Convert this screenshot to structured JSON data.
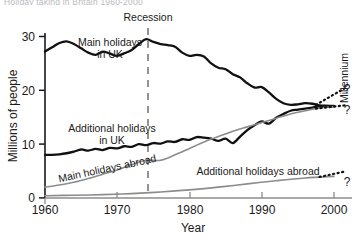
{
  "figure": {
    "cut_off_title": "Holiday taking in Britain 1960-2000",
    "width": 363,
    "height": 246
  },
  "chart_data": {
    "type": "line",
    "title": "",
    "xlabel": "Year",
    "ylabel": "Millions of people",
    "xlim": [
      1960,
      2000
    ],
    "ylim": [
      0,
      30
    ],
    "xticks": [
      "1960",
      "1970",
      "1980",
      "1990",
      "2000"
    ],
    "yticks": [
      "0",
      "10",
      "20",
      "30"
    ],
    "grid": false,
    "legend": "inline-labels",
    "series": [
      {
        "name": "Main holidays in UK",
        "color": "#111111",
        "style": "solid",
        "width": 2.3,
        "label_lines": [
          "Main holidays",
          "in UK"
        ],
        "x": [
          1960,
          1961,
          1962,
          1963,
          1964,
          1965,
          1966,
          1967,
          1968,
          1969,
          1970,
          1971,
          1972,
          1973,
          1974,
          1975,
          1976,
          1977,
          1978,
          1979,
          1980,
          1981,
          1982,
          1983,
          1984,
          1985,
          1986,
          1987,
          1988,
          1989,
          1990,
          1991,
          1992,
          1993,
          1994,
          1995,
          1996,
          1997,
          1998,
          1999,
          2000
        ],
        "y": [
          27.2,
          28.0,
          28.8,
          29.1,
          28.6,
          27.8,
          27.0,
          26.6,
          27.2,
          26.8,
          26.4,
          26.9,
          27.5,
          28.6,
          29.5,
          29.0,
          28.6,
          28.4,
          28.1,
          27.0,
          26.4,
          26.6,
          26.3,
          25.0,
          24.2,
          23.9,
          23.0,
          22.4,
          21.3,
          20.5,
          20.6,
          19.6,
          18.4,
          17.6,
          17.3,
          17.4,
          17.6,
          17.5,
          17.2,
          17.1,
          17.0
        ]
      },
      {
        "name": "Additional holidays in UK",
        "color": "#111111",
        "style": "solid",
        "width": 2.3,
        "label_lines": [
          "Additional holidays",
          "in UK"
        ],
        "x": [
          1960,
          1961,
          1962,
          1963,
          1964,
          1965,
          1966,
          1967,
          1968,
          1969,
          1970,
          1971,
          1972,
          1973,
          1974,
          1975,
          1976,
          1977,
          1978,
          1979,
          1980,
          1981,
          1982,
          1983,
          1984,
          1985,
          1986,
          1987,
          1988,
          1989,
          1990,
          1991,
          1992,
          1993,
          1994,
          1995,
          1996,
          1997,
          1998,
          1999,
          2000
        ],
        "y": [
          8.0,
          8.0,
          8.1,
          8.3,
          8.6,
          9.0,
          8.8,
          9.1,
          8.9,
          9.3,
          9.2,
          9.6,
          9.5,
          10.0,
          9.8,
          10.2,
          10.1,
          10.5,
          10.4,
          10.9,
          10.8,
          11.3,
          11.2,
          11.0,
          10.6,
          11.0,
          10.2,
          11.4,
          12.6,
          13.5,
          14.2,
          13.8,
          14.9,
          15.6,
          16.2,
          16.4,
          16.6,
          16.8,
          17.0,
          17.1,
          17.1
        ]
      },
      {
        "name": "Main holidays abroad",
        "color": "#8c8c8c",
        "style": "solid",
        "width": 1.6,
        "label_lines": [
          "Main holidays abroad"
        ],
        "x": [
          1960,
          1962,
          1964,
          1966,
          1968,
          1970,
          1972,
          1974,
          1976,
          1978,
          1980,
          1982,
          1984,
          1986,
          1988,
          1990,
          1992,
          1994,
          1996,
          1998,
          2000
        ],
        "y": [
          2.0,
          2.4,
          2.9,
          3.6,
          4.4,
          5.2,
          6.2,
          7.0,
          7.0,
          8.0,
          9.2,
          10.4,
          11.4,
          12.4,
          13.2,
          14.0,
          14.8,
          15.6,
          16.2,
          16.7,
          17.0
        ]
      },
      {
        "name": "Additional holidays abroad",
        "color": "#8c8c8c",
        "style": "solid",
        "width": 1.6,
        "label_lines": [
          "Additional holidays abroad"
        ],
        "x": [
          1960,
          1964,
          1968,
          1972,
          1976,
          1980,
          1984,
          1988,
          1992,
          1996,
          2000
        ],
        "y": [
          0.4,
          0.5,
          0.6,
          0.8,
          1.1,
          1.5,
          2.0,
          2.6,
          3.2,
          3.7,
          4.0
        ]
      }
    ],
    "forecasts": [
      {
        "name": "forecast-upper",
        "style": "dotted",
        "from": [
          1997.5,
          17.3
        ],
        "to": [
          2001.5,
          20.4
        ],
        "marker": "?"
      },
      {
        "name": "forecast-middle",
        "style": "dotted",
        "from": [
          1997.5,
          16.6
        ],
        "to": [
          2001.5,
          17.2
        ],
        "marker": "?"
      },
      {
        "name": "forecast-lower",
        "style": "dotted",
        "from": [
          1998.0,
          3.9
        ],
        "to": [
          2001.5,
          4.9
        ],
        "marker": "?"
      }
    ],
    "annotations": [
      {
        "name": "recession",
        "text": "Recession",
        "x": 1974,
        "type": "vline-dashed"
      },
      {
        "name": "millennium",
        "text": "Millennium",
        "x": 2000,
        "type": "rotated-label"
      }
    ],
    "question_marks": [
      "?",
      "?",
      "?"
    ]
  }
}
